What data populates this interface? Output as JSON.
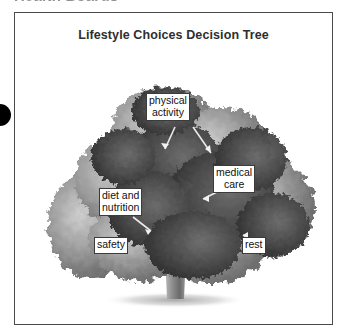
{
  "page": {
    "heading": "Health Boards"
  },
  "marker": {
    "icon": "bullet-circle"
  },
  "figure": {
    "title": "Lifestyle Choices Decision Tree",
    "image_icon": "tree-photograph",
    "image_description": "Grayscale photograph of a broad leafy tree with a single trunk",
    "border_color": "#4a4a4a",
    "background_color": "#ffffff"
  },
  "callouts": [
    {
      "id": "physical-activity",
      "label": "physical\nactivity"
    },
    {
      "id": "medical-care",
      "label": "medical\ncare"
    },
    {
      "id": "diet-and-nutrition",
      "label": "diet and\nnutrition"
    },
    {
      "id": "safety",
      "label": "safety"
    },
    {
      "id": "rest",
      "label": "rest"
    }
  ]
}
